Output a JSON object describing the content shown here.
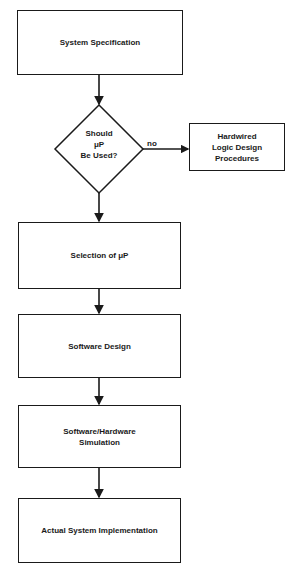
{
  "diagram": {
    "type": "flowchart",
    "nodes": [
      {
        "id": "system_specification",
        "shape": "rectangle",
        "label": "System Specification"
      },
      {
        "id": "decision",
        "shape": "diamond",
        "label": "Should\nμP\nBe Used?"
      },
      {
        "id": "hardwired",
        "shape": "rectangle",
        "label": "Hardwired\nLogic Design\nProcedures"
      },
      {
        "id": "selection",
        "shape": "rectangle",
        "label": "Selection of μP"
      },
      {
        "id": "software_design",
        "shape": "rectangle",
        "label": "Software Design"
      },
      {
        "id": "simulation",
        "shape": "rectangle",
        "label": "Software/Hardware\nSimulation"
      },
      {
        "id": "implementation",
        "shape": "rectangle",
        "label": "Actual System Implementation"
      }
    ],
    "edges": [
      {
        "from": "system_specification",
        "to": "decision",
        "label": ""
      },
      {
        "from": "decision",
        "to": "hardwired",
        "label": "no"
      },
      {
        "from": "decision",
        "to": "selection",
        "label": ""
      },
      {
        "from": "selection",
        "to": "software_design",
        "label": ""
      },
      {
        "from": "software_design",
        "to": "simulation",
        "label": ""
      },
      {
        "from": "simulation",
        "to": "implementation",
        "label": ""
      }
    ]
  },
  "labels": {
    "system_specification": "System Specification",
    "decision": "Should\nμP\nBe Used?",
    "no": "no",
    "hardwired": "Hardwired\nLogic Design\nProcedures",
    "selection": "Selection of μP",
    "software_design": "Software Design",
    "simulation": "Software/Hardware\nSimulation",
    "implementation": "Actual System Implementation"
  }
}
